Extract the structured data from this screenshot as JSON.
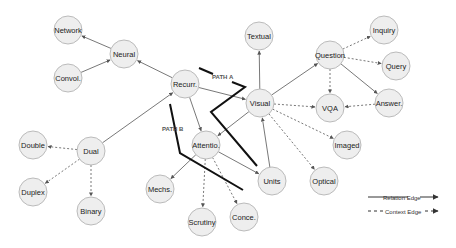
{
  "diagram": {
    "colors": {
      "node_fill": "#eeeeee",
      "node_stroke": "#bbbbbb",
      "edge": "#555555",
      "path": "#111111"
    },
    "nodes": [
      {
        "id": "network",
        "label": "Network",
        "x": 68,
        "y": 30
      },
      {
        "id": "neural",
        "label": "Neural",
        "x": 124,
        "y": 54
      },
      {
        "id": "convol",
        "label": "Convol.",
        "x": 68,
        "y": 78
      },
      {
        "id": "recurr",
        "label": "Recurr.",
        "x": 185,
        "y": 84
      },
      {
        "id": "visual",
        "label": "Visual",
        "x": 260,
        "y": 103
      },
      {
        "id": "textual",
        "label": "Textual",
        "x": 259,
        "y": 36
      },
      {
        "id": "question",
        "label": "Question",
        "x": 330,
        "y": 55
      },
      {
        "id": "inquiry",
        "label": "Inquiry",
        "x": 384,
        "y": 30
      },
      {
        "id": "query",
        "label": "Query",
        "x": 396,
        "y": 66
      },
      {
        "id": "vqa",
        "label": "VQA",
        "x": 330,
        "y": 108
      },
      {
        "id": "answer",
        "label": "Answer.",
        "x": 389,
        "y": 103
      },
      {
        "id": "attentio",
        "label": "Attentio.",
        "x": 206,
        "y": 145
      },
      {
        "id": "units",
        "label": "Units",
        "x": 272,
        "y": 181
      },
      {
        "id": "mechs",
        "label": "Mechs.",
        "x": 160,
        "y": 189
      },
      {
        "id": "scrutiny",
        "label": "Scrutiny",
        "x": 202,
        "y": 222
      },
      {
        "id": "conce",
        "label": "Conce.",
        "x": 244,
        "y": 217
      },
      {
        "id": "dual",
        "label": "Dual",
        "x": 91,
        "y": 151
      },
      {
        "id": "double",
        "label": "Double",
        "x": 33,
        "y": 145
      },
      {
        "id": "duplex",
        "label": "Duplex",
        "x": 33,
        "y": 192
      },
      {
        "id": "binary",
        "label": "Binary",
        "x": 91,
        "y": 211
      },
      {
        "id": "imaged",
        "label": "Imaged",
        "x": 347,
        "y": 145
      },
      {
        "id": "optical",
        "label": "Optical",
        "x": 324,
        "y": 181
      }
    ],
    "edges": [
      {
        "from": "neural",
        "to": "network",
        "type": "relation"
      },
      {
        "from": "convol",
        "to": "neural",
        "type": "relation"
      },
      {
        "from": "recurr",
        "to": "neural",
        "type": "relation"
      },
      {
        "from": "dual",
        "to": "recurr",
        "type": "relation"
      },
      {
        "from": "recurr",
        "to": "visual",
        "type": "relation"
      },
      {
        "from": "recurr",
        "to": "attentio",
        "type": "relation"
      },
      {
        "from": "visual",
        "to": "textual",
        "type": "relation"
      },
      {
        "from": "visual",
        "to": "question",
        "type": "relation"
      },
      {
        "from": "visual",
        "to": "attentio",
        "type": "relation"
      },
      {
        "from": "visual",
        "to": "vqa",
        "type": "context"
      },
      {
        "from": "visual",
        "to": "imaged",
        "type": "context"
      },
      {
        "from": "visual",
        "to": "optical",
        "type": "context"
      },
      {
        "from": "units",
        "to": "visual",
        "type": "relation"
      },
      {
        "from": "attentio",
        "to": "units",
        "type": "relation"
      },
      {
        "from": "attentio",
        "to": "mechs",
        "type": "relation"
      },
      {
        "from": "attentio",
        "to": "scrutiny",
        "type": "context"
      },
      {
        "from": "attentio",
        "to": "conce",
        "type": "context"
      },
      {
        "from": "question",
        "to": "inquiry",
        "type": "context"
      },
      {
        "from": "question",
        "to": "query",
        "type": "context"
      },
      {
        "from": "question",
        "to": "vqa",
        "type": "context"
      },
      {
        "from": "question",
        "to": "answer",
        "type": "relation"
      },
      {
        "from": "answer",
        "to": "vqa",
        "type": "context"
      },
      {
        "from": "dual",
        "to": "double",
        "type": "context"
      },
      {
        "from": "dual",
        "to": "duplex",
        "type": "context"
      },
      {
        "from": "dual",
        "to": "binary",
        "type": "context"
      }
    ],
    "paths": [
      {
        "label": "PATH A",
        "label_x": 212,
        "label_y": 79,
        "points": [
          [
            199,
            68
          ],
          [
            213,
            74
          ]
        ],
        "points2": [
          [
            232,
            82
          ],
          [
            245,
            87
          ],
          [
            211,
            112
          ],
          [
            257,
            166
          ]
        ]
      },
      {
        "label": "PATH B",
        "label_x": 162,
        "label_y": 131,
        "points": [
          [
            170,
            104
          ],
          [
            180,
            153
          ],
          [
            243,
            190
          ]
        ]
      }
    ],
    "legend": {
      "relation_label": "Relation Edge",
      "context_label": "Context Edge"
    }
  }
}
